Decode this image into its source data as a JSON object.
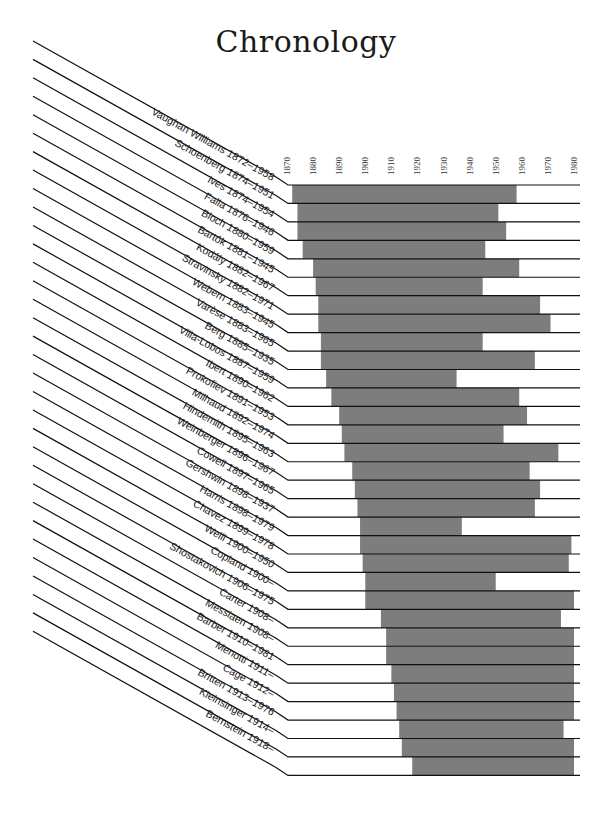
{
  "title": "Chronology",
  "colors": {
    "bar": "#7d7d7d",
    "line": "#111111",
    "background": "#ffffff"
  },
  "chart_data": {
    "type": "bar",
    "orientation": "horizontal",
    "title": "Chronology",
    "xlabel": "",
    "ylabel": "",
    "xlim": [
      1870,
      1980
    ],
    "x_ticks": [
      1870,
      1880,
      1890,
      1900,
      1910,
      1920,
      1930,
      1940,
      1950,
      1960,
      1970,
      1980
    ],
    "grid": false,
    "legend": null,
    "composers": [
      {
        "name": "Vaughan Williams",
        "dates": "1872–1958",
        "start": 1872,
        "end": 1958
      },
      {
        "name": "Schoenberg",
        "dates": "1874–1951",
        "start": 1874,
        "end": 1951
      },
      {
        "name": "Ives",
        "dates": "1874–1954",
        "start": 1874,
        "end": 1954
      },
      {
        "name": "Falla",
        "dates": "1876–1946",
        "start": 1876,
        "end": 1946
      },
      {
        "name": "Bloch",
        "dates": "1880–1959",
        "start": 1880,
        "end": 1959
      },
      {
        "name": "Bartók",
        "dates": "1881–1945",
        "start": 1881,
        "end": 1945
      },
      {
        "name": "Kodály",
        "dates": "1882–1967",
        "start": 1882,
        "end": 1967
      },
      {
        "name": "Stravinsky",
        "dates": "1882–1971",
        "start": 1882,
        "end": 1971
      },
      {
        "name": "Webern",
        "dates": "1883–1945",
        "start": 1883,
        "end": 1945
      },
      {
        "name": "Varèse",
        "dates": "1883–1965",
        "start": 1883,
        "end": 1965
      },
      {
        "name": "Berg",
        "dates": "1885–1935",
        "start": 1885,
        "end": 1935
      },
      {
        "name": "Villa-Lobos",
        "dates": "1887–1959",
        "start": 1887,
        "end": 1959
      },
      {
        "name": "Ibert",
        "dates": "1890–1962",
        "start": 1890,
        "end": 1962
      },
      {
        "name": "Prokofiev",
        "dates": "1891–1953",
        "start": 1891,
        "end": 1953
      },
      {
        "name": "Milhaud",
        "dates": "1892–1974",
        "start": 1892,
        "end": 1974
      },
      {
        "name": "Hindemith",
        "dates": "1895–1963",
        "start": 1895,
        "end": 1963
      },
      {
        "name": "Weinberger",
        "dates": "1896–1967",
        "start": 1896,
        "end": 1967
      },
      {
        "name": "Cowell",
        "dates": "1897–1965",
        "start": 1897,
        "end": 1965
      },
      {
        "name": "Gershwin",
        "dates": "1898–1937",
        "start": 1898,
        "end": 1937
      },
      {
        "name": "Harris",
        "dates": "1898–1979",
        "start": 1898,
        "end": 1979
      },
      {
        "name": "Chavez",
        "dates": "1899–1978",
        "start": 1899,
        "end": 1978
      },
      {
        "name": "Weill",
        "dates": "1900–1950",
        "start": 1900,
        "end": 1950
      },
      {
        "name": "Copland",
        "dates": "1900–",
        "start": 1900,
        "end": null
      },
      {
        "name": "Shostakovich",
        "dates": "1906–1975",
        "start": 1906,
        "end": 1975
      },
      {
        "name": "Carter",
        "dates": "1908–",
        "start": 1908,
        "end": null
      },
      {
        "name": "Messiaen",
        "dates": "1908–",
        "start": 1908,
        "end": null
      },
      {
        "name": "Barber",
        "dates": "1910–1981",
        "start": 1910,
        "end": 1981
      },
      {
        "name": "Menotti",
        "dates": "1911–",
        "start": 1911,
        "end": null
      },
      {
        "name": "Cage",
        "dates": "1912–",
        "start": 1912,
        "end": null
      },
      {
        "name": "Britten",
        "dates": "1913–1976",
        "start": 1913,
        "end": 1976
      },
      {
        "name": "Kleinsinger",
        "dates": "1914–",
        "start": 1914,
        "end": null
      },
      {
        "name": "Bernstein",
        "dates": "1918–",
        "start": 1918,
        "end": null
      }
    ]
  }
}
